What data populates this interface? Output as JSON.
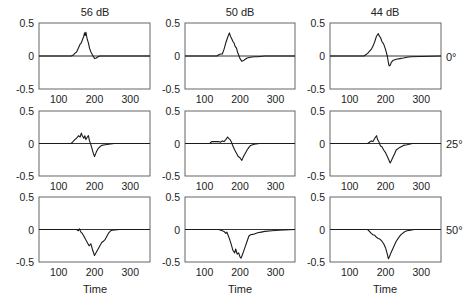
{
  "chart_data": {
    "type": "line",
    "layout": "3x3 small-multiples grid",
    "column_titles": [
      "56 dB",
      "50 dB",
      "44 dB"
    ],
    "row_labels": [
      "0°",
      "25°",
      "50°"
    ],
    "xlabel": "Time",
    "ylabel": "",
    "xlim": [
      45,
      355
    ],
    "ylim": [
      -0.5,
      0.5
    ],
    "xticks": [
      100,
      200,
      300
    ],
    "yticks": [
      -0.5,
      0,
      0.5
    ],
    "ytick_labels": [
      "-0.5",
      "0",
      "0.5"
    ],
    "xtick_labels": [
      "100",
      "200",
      "300"
    ],
    "grid": false,
    "zero_line": true,
    "colors": {
      "line": "#1a1a1a",
      "axes": "#555555",
      "zero": "#333333"
    },
    "panels": [
      {
        "row": 0,
        "col": 0,
        "title": "56 dB",
        "angle": "0°",
        "x": [
          45,
          135,
          140,
          145,
          150,
          155,
          160,
          163,
          166,
          168,
          170,
          172,
          174,
          176,
          178,
          180,
          183,
          186,
          190,
          195,
          200,
          205,
          210,
          215,
          220,
          355
        ],
        "y": [
          0,
          0,
          0.01,
          0.04,
          0.06,
          0.12,
          0.18,
          0.2,
          0.24,
          0.27,
          0.3,
          0.35,
          0.31,
          0.36,
          0.3,
          0.25,
          0.2,
          0.12,
          0.06,
          0.01,
          -0.04,
          -0.03,
          -0.01,
          0,
          0,
          0
        ]
      },
      {
        "row": 0,
        "col": 1,
        "title": "50 dB",
        "angle": "",
        "x": [
          45,
          135,
          140,
          145,
          150,
          155,
          160,
          165,
          170,
          173,
          176,
          180,
          183,
          186,
          190,
          193,
          196,
          200,
          205,
          210,
          215,
          220,
          230,
          240,
          250,
          270,
          355
        ],
        "y": [
          0,
          0,
          0.02,
          0.03,
          0.03,
          0.1,
          0.2,
          0.28,
          0.35,
          0.3,
          0.27,
          0.22,
          0.2,
          0.15,
          0.12,
          0.06,
          0.02,
          -0.04,
          -0.08,
          -0.07,
          -0.05,
          -0.03,
          -0.02,
          -0.01,
          -0.01,
          0,
          0
        ]
      },
      {
        "row": 0,
        "col": 2,
        "title": "44 dB",
        "angle": "0°",
        "x": [
          45,
          140,
          145,
          150,
          155,
          160,
          165,
          170,
          175,
          180,
          183,
          186,
          190,
          195,
          200,
          205,
          208,
          210,
          213,
          216,
          220,
          230,
          240,
          250,
          260,
          270,
          355
        ],
        "y": [
          0,
          0,
          0.02,
          0.04,
          0.07,
          0.1,
          0.15,
          0.22,
          0.3,
          0.34,
          0.3,
          0.28,
          0.22,
          0.18,
          0.1,
          0.0,
          -0.1,
          -0.15,
          -0.14,
          -0.1,
          -0.07,
          -0.05,
          -0.04,
          -0.03,
          -0.02,
          -0.01,
          0
        ]
      },
      {
        "row": 1,
        "col": 0,
        "title": "",
        "angle": "",
        "x": [
          45,
          135,
          140,
          145,
          150,
          155,
          160,
          163,
          166,
          170,
          173,
          176,
          180,
          183,
          186,
          190,
          193,
          196,
          200,
          203,
          206,
          210,
          215,
          220,
          230,
          240,
          255,
          355
        ],
        "y": [
          0,
          0,
          0.03,
          0.06,
          0.08,
          0.12,
          0.1,
          0.16,
          0.12,
          0.08,
          0.12,
          0.06,
          0.1,
          0.12,
          0.04,
          -0.02,
          -0.08,
          -0.14,
          -0.2,
          -0.16,
          -0.12,
          -0.08,
          -0.05,
          -0.03,
          -0.02,
          -0.01,
          0,
          0
        ]
      },
      {
        "row": 1,
        "col": 1,
        "title": "",
        "angle": "",
        "x": [
          45,
          115,
          120,
          130,
          140,
          145,
          150,
          155,
          160,
          165,
          168,
          172,
          176,
          180,
          185,
          190,
          195,
          200,
          205,
          210,
          215,
          220,
          225,
          230,
          240,
          255,
          355
        ],
        "y": [
          0,
          0,
          0.03,
          0.03,
          0.03,
          0.02,
          0.04,
          0.03,
          0.06,
          0.1,
          0.08,
          0.06,
          0.02,
          -0.04,
          -0.1,
          -0.15,
          -0.2,
          -0.22,
          -0.26,
          -0.2,
          -0.15,
          -0.1,
          -0.06,
          -0.03,
          -0.01,
          0,
          0
        ]
      },
      {
        "row": 1,
        "col": 2,
        "title": "",
        "angle": "25°",
        "x": [
          45,
          150,
          155,
          160,
          165,
          170,
          175,
          178,
          182,
          186,
          190,
          195,
          200,
          205,
          210,
          213,
          216,
          220,
          225,
          230,
          240,
          250,
          260,
          275,
          355
        ],
        "y": [
          0,
          0,
          0.02,
          0.04,
          0.03,
          0.08,
          0.12,
          0.06,
          0.02,
          -0.04,
          -0.05,
          -0.1,
          -0.14,
          -0.2,
          -0.26,
          -0.3,
          -0.27,
          -0.22,
          -0.16,
          -0.1,
          -0.06,
          -0.03,
          -0.02,
          0,
          0
        ]
      },
      {
        "row": 2,
        "col": 0,
        "title": "",
        "angle": "",
        "x": [
          45,
          150,
          155,
          158,
          162,
          166,
          170,
          175,
          180,
          185,
          190,
          195,
          200,
          205,
          210,
          215,
          220,
          225,
          230,
          235,
          240,
          245,
          250,
          270,
          355
        ],
        "y": [
          0,
          0,
          -0.02,
          0.01,
          -0.04,
          -0.06,
          -0.1,
          -0.15,
          -0.2,
          -0.25,
          -0.22,
          -0.32,
          -0.4,
          -0.35,
          -0.3,
          -0.25,
          -0.2,
          -0.18,
          -0.15,
          -0.1,
          -0.05,
          -0.02,
          -0.01,
          0,
          0
        ]
      },
      {
        "row": 2,
        "col": 1,
        "title": "",
        "angle": "",
        "x": [
          45,
          140,
          150,
          155,
          160,
          163,
          166,
          170,
          175,
          180,
          185,
          188,
          192,
          196,
          200,
          203,
          206,
          210,
          215,
          220,
          225,
          230,
          240,
          250,
          260,
          270,
          290,
          310,
          355
        ],
        "y": [
          0,
          0,
          -0.02,
          -0.03,
          -0.06,
          -0.04,
          -0.08,
          -0.14,
          -0.22,
          -0.32,
          -0.36,
          -0.3,
          -0.38,
          -0.36,
          -0.42,
          -0.44,
          -0.4,
          -0.34,
          -0.26,
          -0.18,
          -0.1,
          -0.08,
          -0.07,
          -0.05,
          -0.04,
          -0.03,
          -0.02,
          -0.01,
          0
        ]
      },
      {
        "row": 2,
        "col": 2,
        "title": "",
        "angle": "50°",
        "x": [
          45,
          150,
          155,
          160,
          165,
          170,
          175,
          180,
          185,
          190,
          195,
          200,
          205,
          208,
          211,
          215,
          220,
          225,
          230,
          235,
          240,
          245,
          250,
          255,
          260,
          270,
          280,
          355
        ],
        "y": [
          0,
          0,
          -0.03,
          -0.06,
          -0.08,
          -0.09,
          -0.12,
          -0.14,
          -0.15,
          -0.18,
          -0.22,
          -0.28,
          -0.38,
          -0.45,
          -0.42,
          -0.36,
          -0.3,
          -0.24,
          -0.18,
          -0.14,
          -0.1,
          -0.07,
          -0.05,
          -0.03,
          -0.02,
          -0.01,
          0,
          0
        ]
      }
    ]
  }
}
